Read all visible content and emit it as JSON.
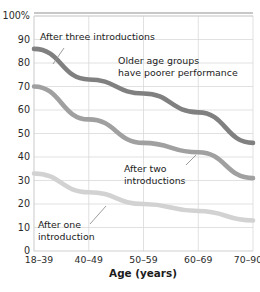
{
  "chart_data": {
    "type": "line",
    "title": "",
    "xlabel": "Age (years)",
    "ylabel": "",
    "categories": [
      "18–39",
      "40–49",
      "50–59",
      "60–69",
      "70–90"
    ],
    "ylim": [
      0,
      100
    ],
    "xlim_note": "categorical, evenly spaced",
    "yticks": [
      0,
      10,
      20,
      30,
      40,
      50,
      60,
      70,
      80,
      90,
      100
    ],
    "ytick_labels": [
      "0",
      "10",
      "20",
      "30",
      "40",
      "50",
      "60",
      "70",
      "80",
      "90",
      "100%"
    ],
    "grid": true,
    "legend": "none (direct labels with leader lines)",
    "series": [
      {
        "name": "After three introductions",
        "color": "#808080",
        "values": [
          86,
          73,
          67,
          59,
          46
        ]
      },
      {
        "name": "After two introductions",
        "color": "#a0a0a0",
        "values": [
          70,
          56,
          46,
          42,
          31
        ]
      },
      {
        "name": "After one introduction",
        "color": "#d2d2d2",
        "values": [
          33,
          25,
          20,
          17,
          13
        ]
      }
    ],
    "annotations": [
      {
        "name": "after-three-introductions",
        "lines": [
          "After three introductions"
        ],
        "x": 40,
        "y": 40,
        "leader": {
          "x1": 64,
          "y1": 48,
          "x2": 53,
          "y2": 64
        }
      },
      {
        "name": "older-age-groups-note",
        "lines": [
          "Older age groups",
          "have poorer performance"
        ],
        "x": 118,
        "y": 64,
        "leader": null
      },
      {
        "name": "after-two-introductions",
        "lines": [
          "After two",
          "introductions"
        ],
        "x": 124,
        "y": 172,
        "leader": {
          "x1": 186,
          "y1": 165,
          "x2": 196,
          "y2": 155
        }
      },
      {
        "name": "after-one-introduction",
        "lines": [
          "After one",
          "introduction"
        ],
        "x": 38,
        "y": 228,
        "leader": {
          "x1": 90,
          "y1": 224,
          "x2": 106,
          "y2": 206
        }
      }
    ],
    "axis_colors": {
      "grid": "#d9d9d9",
      "frame": "#cfcfcf",
      "text": "#2a2a2a"
    }
  }
}
